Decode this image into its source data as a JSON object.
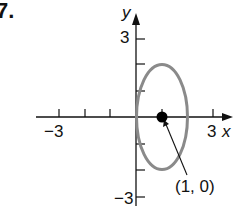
{
  "problem_number": "7.",
  "axes": {
    "x_label": "x",
    "y_label": "y",
    "x_tick_labels": {
      "neg": "−3",
      "pos": "3"
    },
    "y_tick_labels": {
      "pos": "3",
      "neg": "−3"
    },
    "x_range": [
      -3,
      3
    ],
    "y_range": [
      -3,
      3
    ]
  },
  "ellipse": {
    "center": [
      1,
      0
    ],
    "semi_axis_x": 1,
    "semi_axis_y": 2,
    "stroke_color": "#8a8a8a"
  },
  "point": {
    "label": "(1, 0)",
    "x": 1,
    "y": 0,
    "color": "#000000"
  }
}
